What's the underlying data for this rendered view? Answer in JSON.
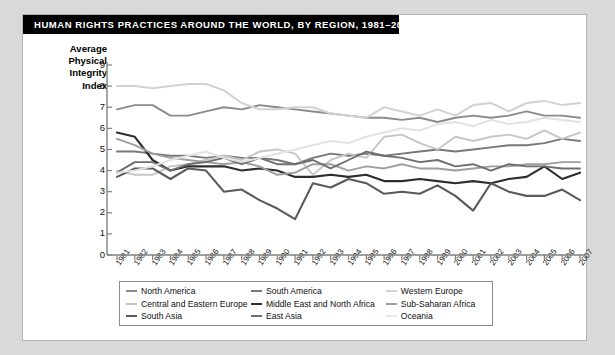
{
  "title": "HUMAN RIGHTS PRACTICES AROUND THE WORLD, BY REGION, 1981–2007",
  "axis_title_lines": [
    "Average",
    "Physical",
    "Integrity",
    "Index"
  ],
  "chart_data": {
    "type": "line",
    "title": "HUMAN RIGHTS PRACTICES AROUND THE WORLD, BY REGION, 1981–2007",
    "xlabel": "",
    "ylabel": "Average Physical Integrity Index",
    "xlim": [
      1981,
      2007
    ],
    "ylim": [
      0,
      9
    ],
    "yticks": [
      0,
      1,
      2,
      3,
      4,
      5,
      6,
      7,
      8,
      9
    ],
    "grid": false,
    "legend_position": "bottom",
    "x": [
      1981,
      1982,
      1983,
      1984,
      1985,
      1986,
      1987,
      1988,
      1989,
      1990,
      1991,
      1992,
      1993,
      1994,
      1995,
      1996,
      1997,
      1998,
      1999,
      2000,
      2001,
      2002,
      2003,
      2004,
      2005,
      2006,
      2007
    ],
    "categories": [
      "1981",
      "1982",
      "1983",
      "1984",
      "1985",
      "1986",
      "1987",
      "1988",
      "1989",
      "1990",
      "1991",
      "1992",
      "1993",
      "1994",
      "1995",
      "1996",
      "1997",
      "1998",
      "1999",
      "2000",
      "2001",
      "2002",
      "2003",
      "2004",
      "2005",
      "2006",
      "2007"
    ],
    "series": [
      {
        "name": "North America",
        "color": "#8a8a8a",
        "width": 1.9,
        "values": [
          6.9,
          7.1,
          7.1,
          6.6,
          6.6,
          6.8,
          7.0,
          6.9,
          7.1,
          7.0,
          6.9,
          6.8,
          6.7,
          6.6,
          6.5,
          6.5,
          6.4,
          6.5,
          6.3,
          6.5,
          6.6,
          6.5,
          6.6,
          6.8,
          6.6,
          6.6,
          6.5
        ]
      },
      {
        "name": "South America",
        "color": "#787878",
        "width": 1.9,
        "values": [
          4.9,
          4.9,
          4.8,
          4.7,
          4.7,
          4.6,
          4.7,
          4.6,
          4.6,
          4.5,
          4.3,
          4.6,
          4.8,
          4.7,
          4.8,
          4.7,
          4.8,
          4.9,
          5.0,
          4.9,
          5.0,
          5.1,
          5.2,
          5.2,
          5.3,
          5.5,
          5.4
        ]
      },
      {
        "name": "Western Europe",
        "color": "#d2d2d2",
        "width": 2.0,
        "values": [
          8.0,
          8.0,
          7.9,
          8.0,
          8.1,
          8.1,
          7.8,
          7.2,
          6.9,
          6.9,
          7.0,
          7.0,
          6.7,
          6.6,
          6.5,
          7.0,
          6.8,
          6.6,
          6.9,
          6.6,
          7.1,
          7.2,
          6.8,
          7.2,
          7.3,
          7.1,
          7.2
        ]
      },
      {
        "name": "Central and Eastern Europe",
        "color": "#c6c6c6",
        "width": 1.9,
        "values": [
          4.0,
          3.8,
          3.8,
          4.2,
          4.3,
          4.5,
          4.7,
          4.5,
          4.9,
          5.0,
          4.8,
          3.8,
          4.5,
          4.8,
          4.6,
          5.6,
          5.7,
          5.3,
          5.0,
          5.6,
          5.4,
          5.6,
          5.7,
          5.5,
          5.9,
          5.5,
          5.8
        ]
      },
      {
        "name": "Middle East and North Africa",
        "color": "#2d2d2d",
        "width": 2.1,
        "values": [
          5.8,
          5.6,
          4.5,
          4.0,
          4.2,
          4.2,
          4.2,
          4.0,
          4.1,
          4.0,
          3.7,
          3.7,
          3.8,
          3.7,
          3.8,
          3.5,
          3.5,
          3.6,
          3.5,
          3.4,
          3.5,
          3.4,
          3.6,
          3.7,
          4.2,
          3.6,
          3.9
        ]
      },
      {
        "name": "Sub-Saharan Africa",
        "color": "#9e9e9e",
        "width": 1.9,
        "values": [
          5.5,
          5.2,
          4.8,
          4.6,
          4.5,
          4.4,
          4.3,
          4.4,
          4.2,
          3.8,
          3.9,
          4.3,
          4.3,
          4.0,
          4.2,
          4.1,
          4.3,
          4.1,
          4.1,
          4.0,
          4.1,
          4.2,
          4.2,
          4.3,
          4.3,
          4.4,
          4.4
        ]
      },
      {
        "name": "South Asia",
        "color": "#5a5a5a",
        "width": 2.1,
        "values": [
          3.7,
          4.1,
          4.1,
          3.6,
          4.1,
          4.0,
          3.0,
          3.1,
          2.6,
          2.2,
          1.7,
          3.4,
          3.2,
          3.6,
          3.4,
          2.9,
          3.0,
          2.9,
          3.3,
          2.8,
          2.1,
          3.4,
          3.0,
          2.8,
          2.8,
          3.1,
          2.6
        ]
      },
      {
        "name": "East Asia",
        "color": "#6e6e6e",
        "width": 1.9,
        "values": [
          3.9,
          4.4,
          4.4,
          4.0,
          4.3,
          4.4,
          4.6,
          4.3,
          4.6,
          4.3,
          4.3,
          4.5,
          4.1,
          4.5,
          4.9,
          4.7,
          4.6,
          4.4,
          4.5,
          4.2,
          4.3,
          4.0,
          4.3,
          4.2,
          4.2,
          4.1,
          4.1
        ]
      },
      {
        "name": "Oceania",
        "color": "#e2e2e2",
        "width": 2.0,
        "values": [
          3.9,
          4.0,
          4.2,
          4.5,
          4.7,
          4.9,
          4.6,
          4.4,
          4.6,
          4.8,
          5.0,
          5.2,
          5.4,
          5.3,
          5.6,
          5.8,
          6.0,
          5.9,
          6.2,
          6.3,
          6.1,
          6.4,
          6.2,
          6.3,
          6.5,
          6.4,
          6.3
        ]
      }
    ]
  },
  "legend": {
    "rows": [
      [
        {
          "label": "North America",
          "color": "#8a8a8a",
          "width": 2.0
        },
        {
          "label": "South America",
          "color": "#787878",
          "width": 2.0
        },
        {
          "label": "Western Europe",
          "color": "#d2d2d2",
          "width": 2.0
        }
      ],
      [
        {
          "label": "Central and Eastern Europe",
          "color": "#c6c6c6",
          "width": 2.0
        },
        {
          "label": "Middle East and North Africa",
          "color": "#2d2d2d",
          "width": 2.4
        },
        {
          "label": "Sub-Saharan Africa",
          "color": "#9e9e9e",
          "width": 2.0
        }
      ],
      [
        {
          "label": "South Asia",
          "color": "#5a5a5a",
          "width": 2.2
        },
        {
          "label": "East Asia",
          "color": "#6e6e6e",
          "width": 2.0
        },
        {
          "label": "Oceania",
          "color": "#e8e8e8",
          "width": 2.0
        }
      ]
    ]
  }
}
